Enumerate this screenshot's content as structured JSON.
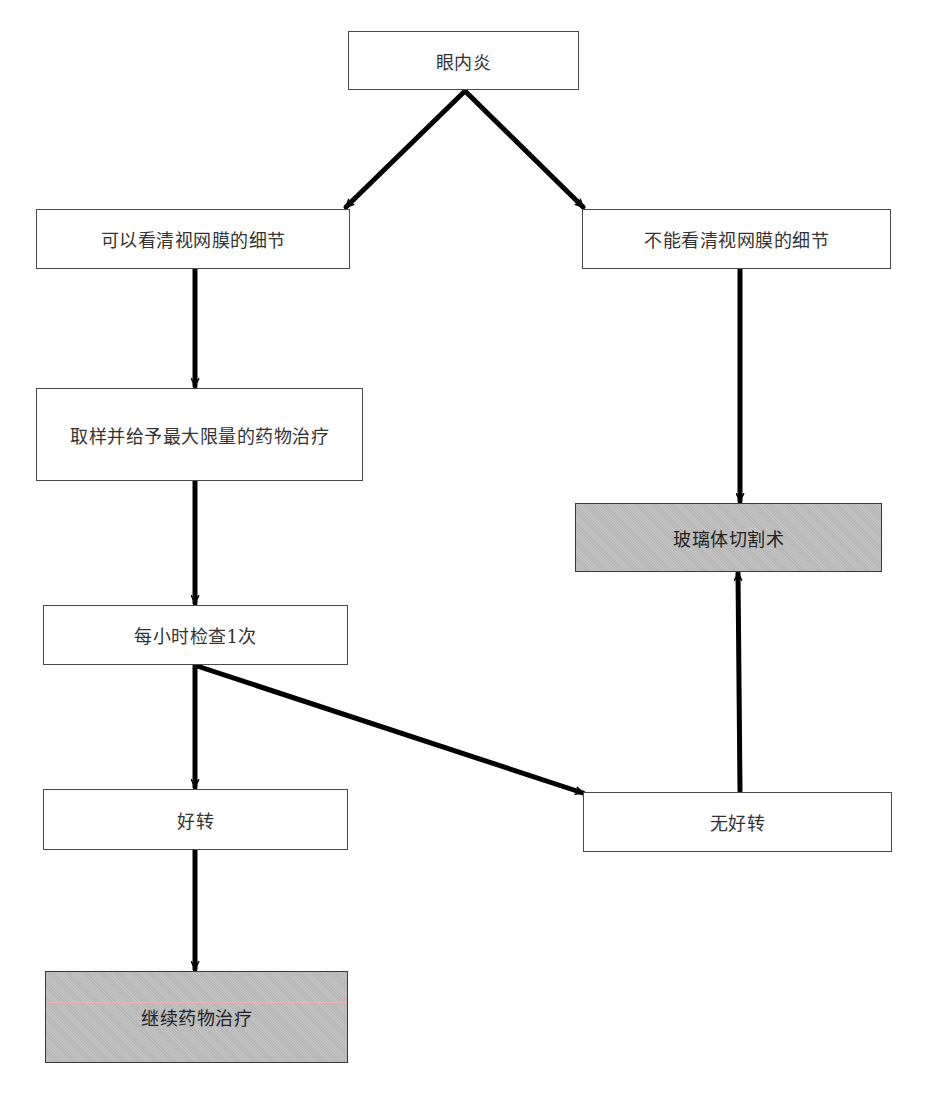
{
  "diagram": {
    "type": "flowchart",
    "nodes": {
      "root": "眼内炎",
      "visible": "可以看清视网膜的细节",
      "not_visible": "不能看清视网膜的细节",
      "sample_treat": "取样并给予最大限量的药物治疗",
      "hourly_check": "每小时检查1次",
      "improved": "好转",
      "not_improved": "无好转",
      "continue_meds": "继续药物治疗",
      "vitrectomy": "玻璃体切割术"
    },
    "edges": [
      {
        "from": "root",
        "to": "visible"
      },
      {
        "from": "root",
        "to": "not_visible"
      },
      {
        "from": "visible",
        "to": "sample_treat"
      },
      {
        "from": "sample_treat",
        "to": "hourly_check"
      },
      {
        "from": "hourly_check",
        "to": "improved"
      },
      {
        "from": "hourly_check",
        "to": "not_improved"
      },
      {
        "from": "improved",
        "to": "continue_meds"
      },
      {
        "from": "not_visible",
        "to": "vitrectomy"
      },
      {
        "from": "not_improved",
        "to": "vitrectomy"
      }
    ],
    "colors": {
      "box_fill": "#ffffff",
      "terminal_fill": "#bdbdbd",
      "border": "#4a4a4a",
      "arrow": "#000000"
    }
  }
}
